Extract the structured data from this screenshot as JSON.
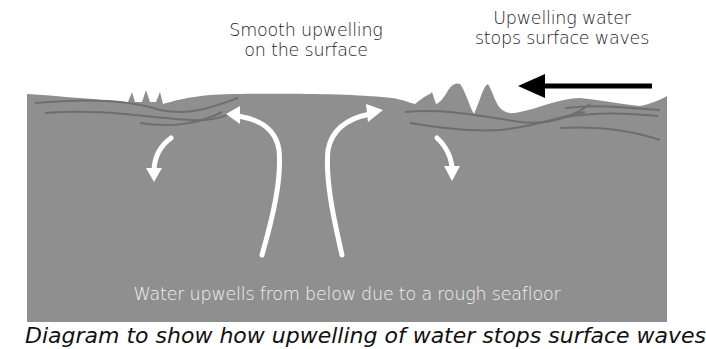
{
  "diagram": {
    "labels": {
      "smooth_upwelling_line1": "Smooth upwelling",
      "smooth_upwelling_line2": "on the surface",
      "stops_waves_line1": "Upwelling water",
      "stops_waves_line2": "stops surface waves",
      "bottom": "Water upwells from below due to a rough seafloor"
    },
    "caption": "Diagram to show how upwelling of water stops surface waves",
    "colors": {
      "water": "#8f8f8f",
      "current_lines": "#6f6f6f",
      "flow_arrows": "#ffffff",
      "wave_arrow": "#000000",
      "text": "#222222"
    },
    "icons": {
      "wave_direction_arrow": "arrow-left-icon",
      "flow_arrows": [
        "curved-arrow-down-left-icon",
        "curved-arrow-up-left-icon",
        "curved-arrow-up-right-icon",
        "curved-arrow-down-right-icon"
      ]
    }
  }
}
